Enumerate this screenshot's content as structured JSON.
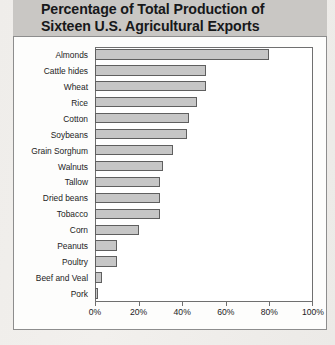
{
  "header": {
    "title": "Percentage of Total Production of\nSixteen U.S. Agricultural Exports"
  },
  "colors": {
    "header_band": "#c9c7c4",
    "panel_background": "#fdfdfc",
    "panel_border": "#8d8d8d",
    "bar_fill": "#c6c6c6",
    "bar_border": "#5f5f5f",
    "axis": "#6f6f6f",
    "text": "#1c1c1c",
    "page_background": "#efedea"
  },
  "chart_data": {
    "type": "bar",
    "orientation": "horizontal",
    "title": "Percentage of Total Production of Sixteen U.S. Agricultural Exports",
    "xlabel": "",
    "ylabel": "",
    "xlim": [
      0,
      100
    ],
    "grid": false,
    "legend": null,
    "tick_labels": [
      "0%",
      "20%",
      "40%",
      "60%",
      "80%",
      "100%"
    ],
    "tick_values": [
      0,
      20,
      40,
      60,
      80,
      100
    ],
    "categories": [
      "Almonds",
      "Cattle hides",
      "Wheat",
      "Rice",
      "Cotton",
      "Soybeans",
      "Grain Sorghum",
      "Walnuts",
      "Tallow",
      "Dried beans",
      "Tobacco",
      "Corn",
      "Peanuts",
      "Poultry",
      "Beef and Veal",
      "Pork"
    ],
    "values": [
      80,
      51,
      51,
      47,
      43,
      42,
      36,
      31,
      30,
      30,
      30,
      20,
      10,
      10,
      3,
      1.5
    ],
    "units": "percent"
  }
}
